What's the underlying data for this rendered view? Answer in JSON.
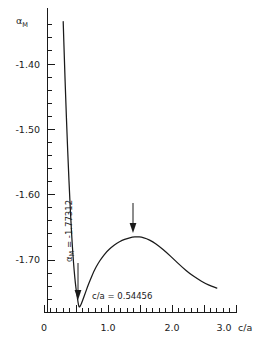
{
  "chart_data": {
    "type": "line",
    "title": "",
    "subtitle": "",
    "xlabel": "c/a",
    "ylabel": "αM",
    "ylabel_base": "α",
    "ylabel_sub": "M",
    "xlim": [
      0,
      3.2
    ],
    "ylim": [
      -1.79,
      -1.33
    ],
    "grid": false,
    "legend": null,
    "x_ticks_major": [
      "0",
      "1.0",
      "2.0",
      "3.0"
    ],
    "x_ticks_major_values": [
      0,
      1.0,
      2.0,
      3.0
    ],
    "x_tick_minor_step": 0.1,
    "x_tick_major_step": 0.5,
    "y_ticks_major": [
      "-1.40",
      "-1.50",
      "-1.60",
      "-1.70"
    ],
    "y_ticks_major_values": [
      -1.4,
      -1.5,
      -1.6,
      -1.7
    ],
    "y_tick_minor_step": 0.02,
    "series": [
      {
        "name": "Madelung constant vs axial ratio",
        "x": [
          0.3,
          0.32,
          0.34,
          0.36,
          0.38,
          0.4,
          0.42,
          0.44,
          0.46,
          0.48,
          0.5,
          0.52,
          0.545,
          0.57,
          0.6,
          0.64,
          0.68,
          0.72,
          0.78,
          0.84,
          0.9,
          0.98,
          1.06,
          1.14,
          1.22,
          1.3,
          1.38,
          1.46,
          1.52,
          1.6,
          1.7,
          1.8,
          1.92,
          2.04,
          2.16,
          2.28,
          2.4,
          2.52,
          2.62,
          2.7
        ],
        "y": [
          -1.335,
          -1.398,
          -1.455,
          -1.508,
          -1.556,
          -1.6,
          -1.64,
          -1.674,
          -1.703,
          -1.726,
          -1.744,
          -1.757,
          -1.77312,
          -1.77,
          -1.763,
          -1.752,
          -1.741,
          -1.731,
          -1.717,
          -1.706,
          -1.697,
          -1.687,
          -1.68,
          -1.674,
          -1.67,
          -1.667,
          -1.665,
          -1.6645,
          -1.665,
          -1.667,
          -1.672,
          -1.679,
          -1.689,
          -1.7,
          -1.711,
          -1.721,
          -1.729,
          -1.736,
          -1.74,
          -1.743
        ]
      }
    ],
    "annotations": [
      {
        "id": "global-minimum",
        "text_rotated": "αM = -1.77312",
        "text_rotated_base": "α",
        "text_rotated_sub": "M",
        "text_rotated_rest": " = -1.77312",
        "text_horizontal": "c/a = 0.54456",
        "x": 0.54456,
        "y": -1.77312,
        "arrow": "down"
      },
      {
        "id": "local-maximum",
        "text_rotated": "",
        "text_horizontal": "",
        "x": 1.52,
        "y": -1.6645,
        "arrow": "down"
      }
    ]
  },
  "labels": {
    "y_axis": "α",
    "y_axis_sub": "M",
    "x_axis": "c/a",
    "min_value_label": " = -1.77312",
    "min_ca_label": "c/a = 0.54456",
    "y0": "-1.40",
    "y1": "-1.50",
    "y2": "-1.60",
    "y3": "-1.70",
    "x0": "0",
    "x1": "1.0",
    "x2": "2.0",
    "x3": "3.0"
  },
  "colors": {
    "ink": "#1a1a1a",
    "background": "#ffffff"
  }
}
